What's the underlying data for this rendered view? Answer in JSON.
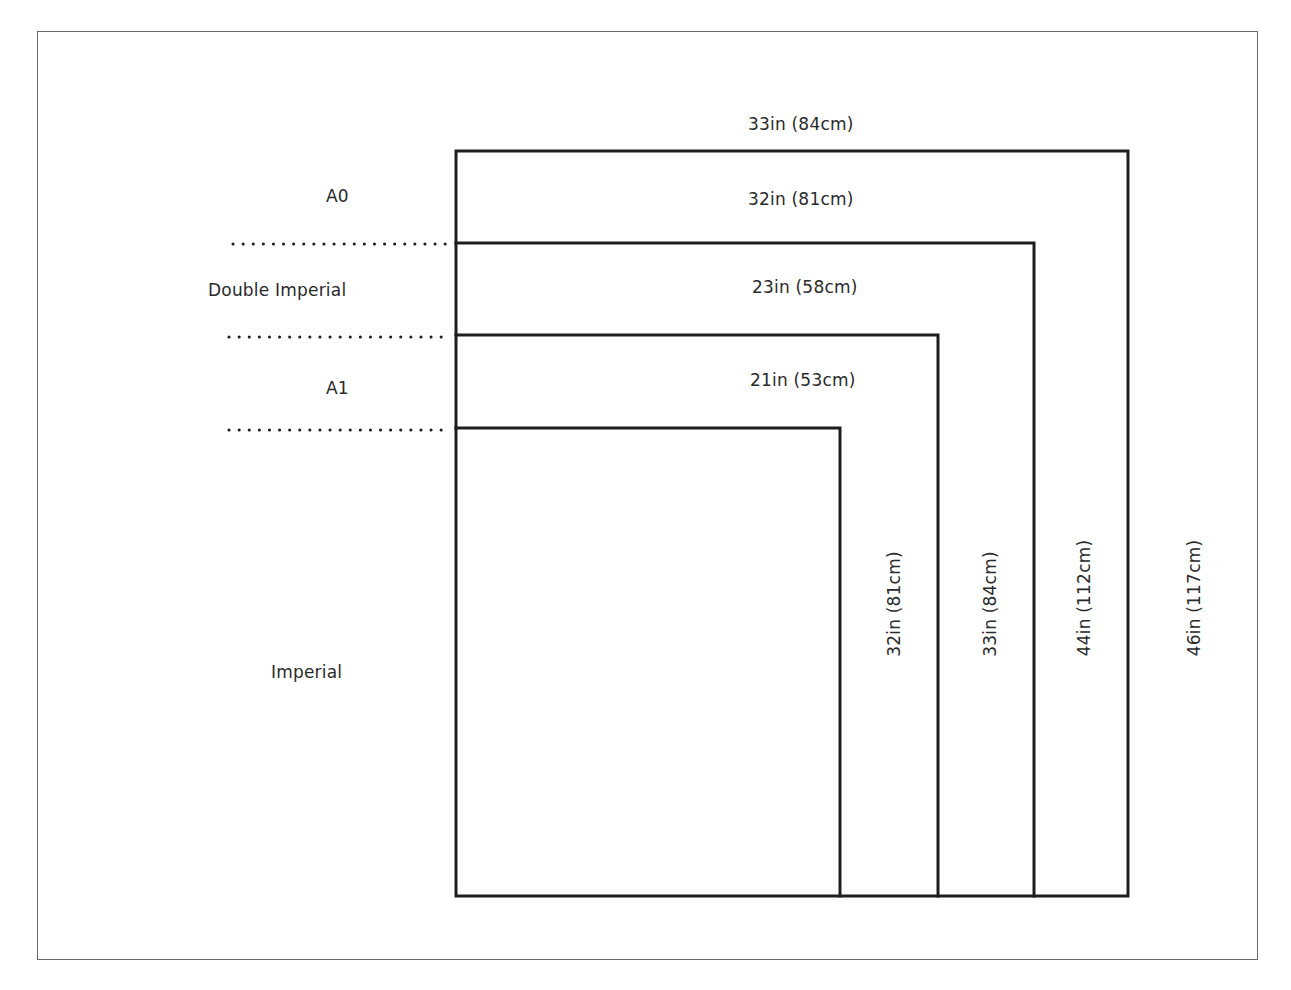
{
  "diagram": {
    "title": "",
    "colors": {
      "line": "#1e1e1e",
      "frame": "#6a6a6a",
      "text": "#2a2a2a"
    },
    "paper_sizes": [
      {
        "name": "A0",
        "width_label": "33in (84cm)",
        "height_label": "46in (117cm)"
      },
      {
        "name": "Double Imperial",
        "width_label": "32in (81cm)",
        "height_label": "44in (112cm)"
      },
      {
        "name": "A1",
        "width_label": "23in (58cm)",
        "height_label": "33in (84cm)"
      },
      {
        "name": "Imperial",
        "width_label": "21in (53cm)",
        "height_label": "32in (81cm)"
      }
    ]
  }
}
